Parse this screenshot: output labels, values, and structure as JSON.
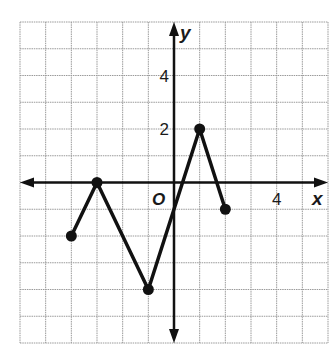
{
  "chart_data": {
    "type": "line",
    "title": "",
    "xlabel": "x",
    "ylabel": "y",
    "origin_label": "O",
    "xlim": [
      -6,
      6
    ],
    "ylim": [
      -6,
      6
    ],
    "grid": true,
    "x_tick_labels": [
      {
        "value": 4,
        "label": "4"
      }
    ],
    "y_tick_labels": [
      {
        "value": 4,
        "label": "4"
      },
      {
        "value": 2,
        "label": "2"
      }
    ],
    "series": [
      {
        "name": "piecewise",
        "points": [
          [
            -4,
            -2
          ],
          [
            -3,
            0
          ],
          [
            -1,
            -4
          ],
          [
            1,
            2
          ],
          [
            2,
            -1
          ]
        ],
        "endpoints_closed": true
      }
    ],
    "colors": {
      "line": "#111111",
      "grid": "#9a9a9a",
      "axis": "#111111"
    }
  }
}
